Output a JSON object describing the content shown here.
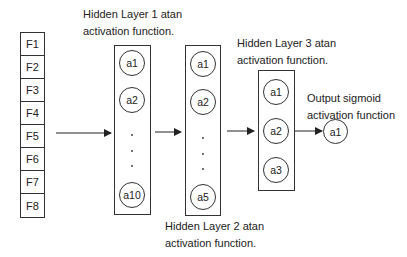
{
  "input_layer": {
    "features": [
      "F1",
      "F2",
      "F3",
      "F4",
      "F5",
      "F6",
      "F7",
      "F8"
    ]
  },
  "hidden_layer_1": {
    "label_line1": "Hidden Layer 1 atan",
    "label_line2": "activation function.",
    "nodes": [
      "a1",
      "a2",
      "a10"
    ]
  },
  "hidden_layer_2": {
    "label_line1": "Hidden Layer 2 atan",
    "label_line2": "activation function.",
    "nodes": [
      "a1",
      "a2",
      "a5"
    ]
  },
  "hidden_layer_3": {
    "label_line1": "Hidden Layer 3 atan",
    "label_line2": "activation function.",
    "nodes": [
      "a1",
      "a2",
      "a3"
    ]
  },
  "output_layer": {
    "label_line1": "Output sigmoid",
    "label_line2": "activation function",
    "nodes": [
      "a1"
    ]
  }
}
